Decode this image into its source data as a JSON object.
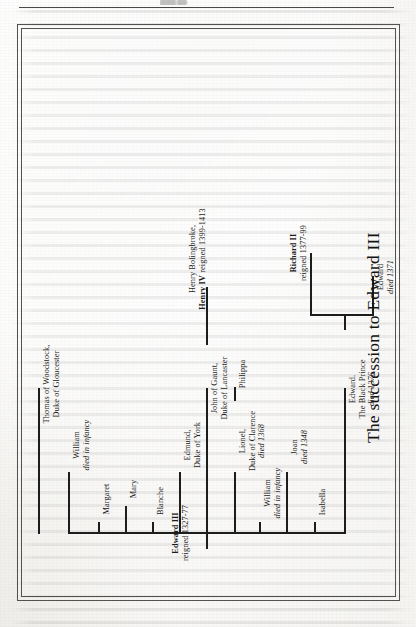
{
  "figure": {
    "title": "The succession to Edward III",
    "root": {
      "name": "Edward III",
      "detail": "reigned 1327-77"
    },
    "children": [
      {
        "id": "edward-black-prince",
        "lines": [
          "Edward.",
          "The Black Prince",
          "died 1376"
        ],
        "italic_lines": [
          2
        ]
      },
      {
        "id": "isabella",
        "lines": [
          "Isabella"
        ],
        "italic_lines": []
      },
      {
        "id": "joan",
        "lines": [
          "Joan",
          "died 1348"
        ],
        "italic_lines": [
          1
        ]
      },
      {
        "id": "william-infancy",
        "lines": [
          "William",
          "died in infancy"
        ],
        "italic_lines": [
          1
        ]
      },
      {
        "id": "lionel-clarence",
        "lines": [
          "Lionel,",
          "Duke of Clarence",
          "died 1368"
        ],
        "italic_lines": [
          2
        ]
      },
      {
        "id": "john-of-gaunt",
        "lines": [
          "John of Gaunt,",
          "Duke of Lancaster"
        ],
        "italic_lines": []
      },
      {
        "id": "edmund-york",
        "lines": [
          "Edmund,",
          "Duke of York"
        ],
        "italic_lines": []
      },
      {
        "id": "blanche",
        "lines": [
          "Blanche"
        ],
        "italic_lines": []
      },
      {
        "id": "mary",
        "lines": [
          "Mary"
        ],
        "italic_lines": []
      },
      {
        "id": "margaret",
        "lines": [
          "Margaret"
        ],
        "italic_lines": []
      },
      {
        "id": "william-2-infancy",
        "lines": [
          "William",
          "died in infancy"
        ],
        "italic_lines": [
          1
        ]
      },
      {
        "id": "thomas-woodstock",
        "lines": [
          "Thomas of Woodstock,",
          "Duke of Gloucester"
        ],
        "italic_lines": []
      }
    ],
    "grandchildren": [
      {
        "id": "edward-1371",
        "parent": "edward-black-prince",
        "lines": [
          "Edward",
          "died 1371"
        ],
        "italic_lines": [
          1
        ]
      },
      {
        "id": "richard-ii",
        "parent": "edward-black-prince",
        "lines": [
          "Richard II",
          "reigned 1377-99"
        ],
        "bold_lines": [
          0
        ]
      },
      {
        "id": "philippa",
        "parent": "lionel-clarence",
        "lines": [
          "Philippa"
        ],
        "italic_lines": []
      },
      {
        "id": "henry-iv",
        "parent": "john-of-gaunt",
        "lines": [
          "Henry Bolingbroke,",
          "Henry IV reigned 1399-1413"
        ],
        "bold_lines": [
          1
        ]
      }
    ],
    "labels": {
      "edward_iii_name": "Edward III",
      "edward_iii_reign": "reigned 1327-77",
      "edward_black_prince_l1": "Edward.",
      "edward_black_prince_l2": "The Black Prince",
      "edward_black_prince_l3": "died 1376",
      "edward_1371_l1": "Edward",
      "edward_1371_l2": "died 1371",
      "richard_ii_l1": "Richard II",
      "richard_ii_l2": "reigned 1377-99",
      "isabella": "Isabella",
      "joan_l1": "Joan",
      "joan_l2": "died 1348",
      "william_l1": "William",
      "william_l2": "died in infancy",
      "lionel_l1": "Lionel,",
      "lionel_l2": "Duke of Clarence",
      "lionel_l3": "died 1368",
      "philippa": "Philippa",
      "gaunt_l1": "John of Gaunt,",
      "gaunt_l2": "Duke of Lancaster",
      "henry_l1": "Henry Bolingbroke,",
      "henry_l2a": "Henry IV",
      "henry_l2b": "reigned 1399-1413",
      "edmund_l1": "Edmund,",
      "edmund_l2": "Duke of York",
      "blanche": "Blanche",
      "mary": "Mary",
      "margaret": "Margaret",
      "william2_l1": "William",
      "william2_l2": "died in infancy",
      "thomas_l1": "Thomas of Woodstock,",
      "thomas_l2": "Duke of Gloucester"
    },
    "colors": {
      "ink": "#1d1d1d",
      "frame": "#54524f",
      "paper": "#efeeea"
    }
  }
}
